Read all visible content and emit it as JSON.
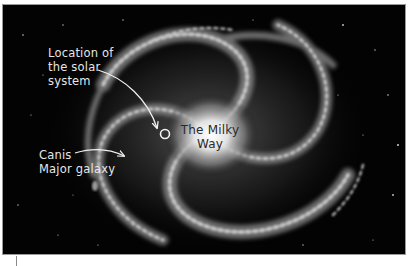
{
  "figure": {
    "alt": "Spiral galaxy illustration of the Milky Way",
    "background_color": "#030303",
    "page_color": "#ffffff",
    "annotation_color": "#e6e6e6",
    "center_label_color": "#2a2a2a"
  },
  "labels": {
    "solar_system": {
      "lines": [
        "Location of",
        "the solar",
        "system"
      ]
    },
    "milky_way": {
      "lines": [
        "The Milky",
        "Way"
      ]
    },
    "canis_major": {
      "lines": [
        "Canis",
        "Major galaxy"
      ]
    }
  },
  "markers": {
    "solar_system_marker": "circle-marker-icon",
    "solar_arrow": "curved-arrow-icon",
    "canis_arrow": "curved-arrow-icon"
  }
}
